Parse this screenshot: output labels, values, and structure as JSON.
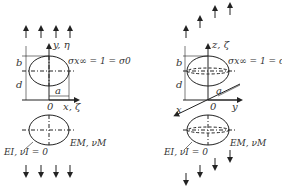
{
  "left_panel": {
    "axis_vertical": "y, η",
    "axis_horizontal": "x, ζ",
    "origin": "0",
    "dim_b": "b",
    "dim_d": "d",
    "dim_a": "a",
    "stress": "σx∞ = 1 = σ0",
    "matrix": "EM, νM",
    "inclusion": "EI, νI = 0"
  },
  "right_panel": {
    "axis_vertical": "z, ζ",
    "axis_x": "x",
    "axis_y": "y",
    "origin": "0",
    "dim_b": "b",
    "dim_d": "d",
    "dim_a": "a",
    "stress": "σx∞ = 1 = σ0",
    "matrix": "EM, νM",
    "inclusion": "EI, νI = 0"
  }
}
